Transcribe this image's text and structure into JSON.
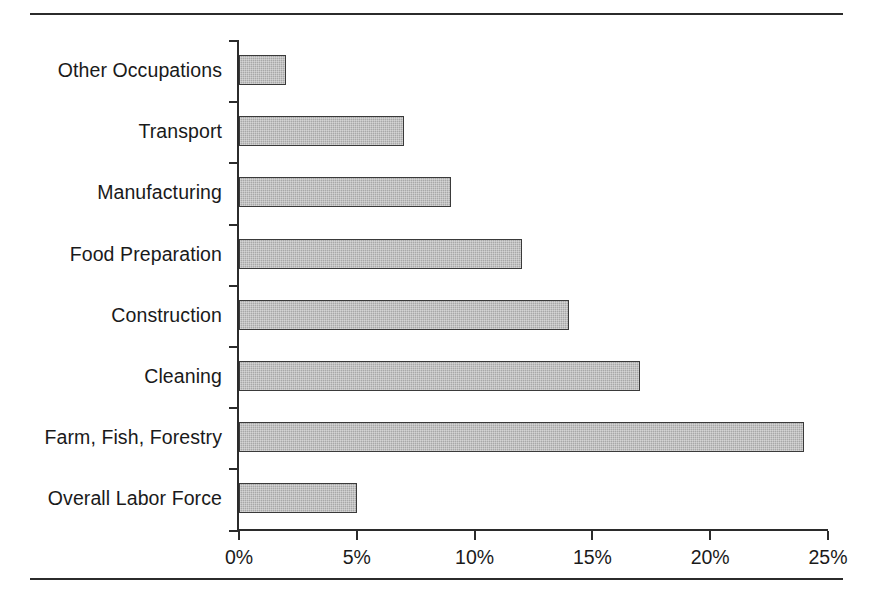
{
  "figure": {
    "top_rule": "horizontal-rule",
    "bottom_rule": "horizontal-rule"
  },
  "chart_data": {
    "type": "bar",
    "orientation": "horizontal",
    "title": "",
    "xlabel": "",
    "ylabel": "",
    "categories": [
      "Other Occupations",
      "Transport",
      "Manufacturing",
      "Food Preparation",
      "Construction",
      "Cleaning",
      "Farm, Fish, Forestry",
      "Overall Labor Force"
    ],
    "values": [
      2,
      7,
      9,
      12,
      14,
      17,
      24,
      5
    ],
    "value_suffix": "%",
    "xlim": [
      0,
      25
    ],
    "xticks": [
      0,
      5,
      10,
      15,
      20,
      25
    ],
    "xtick_labels": [
      "0%",
      "5%",
      "10%",
      "15%",
      "20%",
      "25%"
    ],
    "grid": false,
    "legend": null,
    "bar_fill_color": "#a8a8a8",
    "bar_edge_color": "#3a3a3a",
    "axis_color": "#2b2b2b"
  }
}
